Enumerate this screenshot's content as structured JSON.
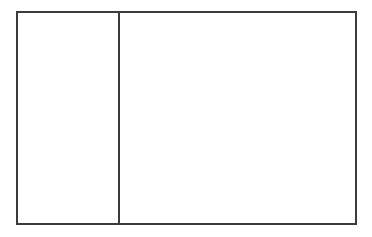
{
  "layout": {
    "type": "two-pane",
    "border_color": "#3c3c3c",
    "background_color": "#ffffff"
  },
  "left_pane": {
    "content": ""
  },
  "right_pane": {
    "content": ""
  }
}
